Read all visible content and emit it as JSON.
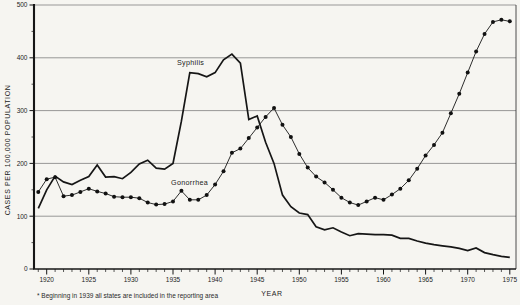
{
  "chart_data": {
    "type": "line",
    "title": "",
    "xlabel": "YEAR",
    "ylabel": "CASES PER 100,000 POPULATION",
    "footnote": "* Beginning in 1939 all states are included in the reporting area",
    "xlim": [
      1918.5,
      1976.5
    ],
    "ylim": [
      0,
      500
    ],
    "grid": "horizontal",
    "legend_position": "inline-labels",
    "y_ticks": [
      0,
      100,
      200,
      300,
      400,
      500
    ],
    "x_ticks_major": [
      1920,
      1925,
      1930,
      1935,
      1940,
      1945,
      1950,
      1955,
      1960,
      1965,
      1970,
      1975
    ],
    "x": [
      1919,
      1920,
      1921,
      1922,
      1923,
      1924,
      1925,
      1926,
      1927,
      1928,
      1929,
      1930,
      1931,
      1932,
      1933,
      1934,
      1935,
      1936,
      1937,
      1938,
      1939,
      1940,
      1941,
      1942,
      1943,
      1944,
      1945,
      1946,
      1947,
      1948,
      1949,
      1950,
      1951,
      1952,
      1953,
      1954,
      1955,
      1956,
      1957,
      1958,
      1959,
      1960,
      1961,
      1962,
      1963,
      1964,
      1965,
      1966,
      1967,
      1968,
      1969,
      1970,
      1971,
      1972,
      1973,
      1974,
      1975
    ],
    "series": [
      {
        "name": "Syphilis",
        "marker": "none",
        "stroke_width": 1.7,
        "values": [
          115,
          150,
          176,
          165,
          160,
          168,
          175,
          197,
          174,
          175,
          171,
          183,
          199,
          206,
          191,
          189,
          200,
          280,
          372,
          370,
          364,
          372,
          396,
          407,
          390,
          283,
          290,
          240,
          200,
          140,
          118,
          106,
          103,
          80,
          74,
          78,
          70,
          63,
          67,
          66,
          65,
          65,
          64,
          58,
          58,
          53,
          49,
          46,
          44,
          42,
          39,
          35,
          40,
          31,
          27,
          24,
          22
        ]
      },
      {
        "name": "Gonorrhea",
        "marker": "dot",
        "stroke_width": 0.9,
        "values": [
          146,
          170,
          174,
          138,
          140,
          146,
          152,
          147,
          143,
          137,
          136,
          136,
          134,
          126,
          122,
          123,
          128,
          148,
          131,
          131,
          140,
          160,
          185,
          220,
          228,
          248,
          268,
          288,
          305,
          273,
          250,
          218,
          192,
          175,
          164,
          150,
          135,
          126,
          121,
          128,
          135,
          131,
          141,
          152,
          168,
          190,
          215,
          235,
          258,
          295,
          332,
          372,
          412,
          445,
          468,
          472,
          469
        ]
      }
    ],
    "colors": {
      "line": "#161616",
      "grid": "#707070",
      "background": "#f6f5f1",
      "marker": "#111111"
    }
  }
}
